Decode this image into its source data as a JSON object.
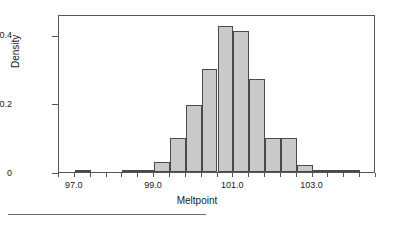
{
  "chart_data": {
    "type": "bar",
    "title": "",
    "subtitle": "",
    "xlabel": "Meltpoint",
    "ylabel": "Density",
    "legend": [],
    "grid": false,
    "xlim": [
      96.6,
      104.6
    ],
    "ylim": [
      0,
      0.46
    ],
    "xticks": [
      97.0,
      99.0,
      101.0,
      103.0
    ],
    "xtick_labels": [
      "97.0",
      "99.0",
      "101.0",
      "103.0"
    ],
    "yticks": [
      0,
      0.2,
      0.4
    ],
    "ytick_labels": [
      "0",
      "0.2",
      "0.4"
    ],
    "bin_width": 0.4,
    "bin_edges": [
      96.6,
      97.0,
      97.4,
      97.8,
      98.2,
      98.6,
      99.0,
      99.4,
      99.8,
      100.2,
      100.6,
      101.0,
      101.4,
      101.8,
      102.2,
      102.6,
      103.0,
      103.4,
      103.8,
      104.2,
      104.6
    ],
    "categories": [
      "96.6-97.0",
      "97.0-97.4",
      "97.4-97.8",
      "97.8-98.2",
      "98.2-98.6",
      "98.6-99.0",
      "99.0-99.4",
      "99.4-99.8",
      "99.8-100.2",
      "100.2-100.6",
      "100.6-101.0",
      "101.0-101.4",
      "101.4-101.8",
      "101.8-102.2",
      "102.2-102.6",
      "102.6-103.0",
      "103.0-103.4",
      "103.4-103.8",
      "103.8-104.2",
      "104.2-104.6"
    ],
    "values": [
      0,
      0.007,
      0,
      0,
      0.005,
      0.005,
      0.03,
      0.1,
      0.195,
      0.3,
      0.425,
      0.41,
      0.27,
      0.1,
      0.1,
      0.02,
      0.007,
      0.004,
      0.004,
      0
    ],
    "bar_fill_color": "#c9c9c9",
    "bar_edge_color": "#4a4a4a",
    "frame_color": "#555555",
    "background_color": "#ffffff"
  },
  "axes": {
    "y_title": "Density",
    "x_title": "Meltpoint"
  }
}
